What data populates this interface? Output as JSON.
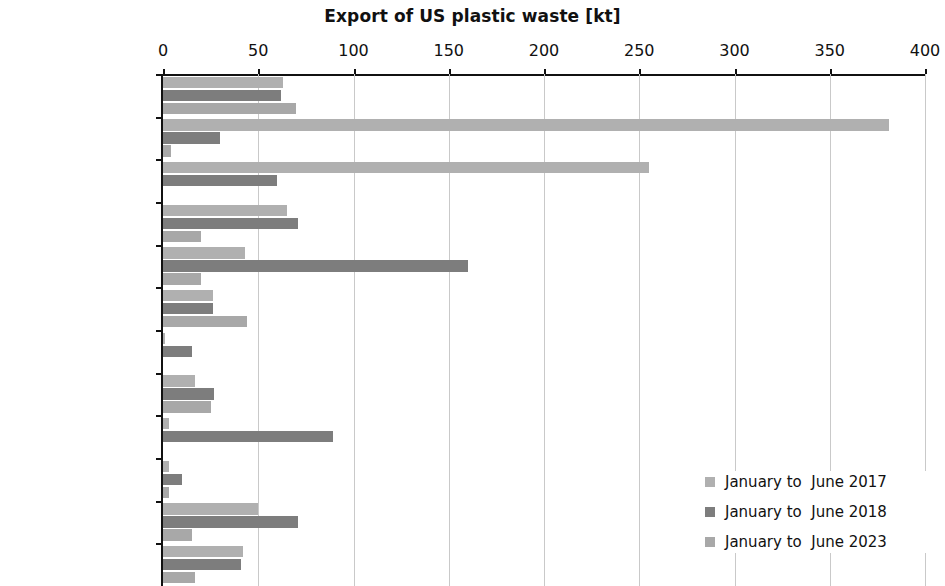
{
  "chart_data": {
    "type": "bar",
    "orientation": "horizontal",
    "title": "Export of US plastic waste [kt]",
    "xlabel": "",
    "ylabel": "",
    "xlim": [
      0,
      400
    ],
    "xticks": [
      0,
      50,
      100,
      150,
      200,
      250,
      300,
      350,
      400
    ],
    "grid": true,
    "legend_position": "bottom-right",
    "categories": [
      "Canada",
      "China",
      "Hong Kong",
      "India",
      "Malaysia",
      "Mexico",
      "South Korea",
      "Taiwan",
      "Thailand",
      "Turkey",
      "Vietnam",
      "Rest of the World"
    ],
    "series": [
      {
        "name": "January to  June 2017",
        "color": "#b0b0b0",
        "values": [
          63,
          381,
          255,
          65,
          43,
          26,
          1,
          17,
          3,
          3,
          50,
          42
        ]
      },
      {
        "name": "January to  June 2018",
        "color": "#7d7d7d",
        "values": [
          62,
          30,
          60,
          71,
          160,
          26,
          15,
          27,
          89,
          10,
          71,
          41
        ]
      },
      {
        "name": "January to  June 2023",
        "color": "#a8a8a8",
        "values": [
          70,
          4,
          0,
          20,
          20,
          44,
          0,
          25,
          0,
          3,
          15,
          17
        ]
      }
    ]
  }
}
